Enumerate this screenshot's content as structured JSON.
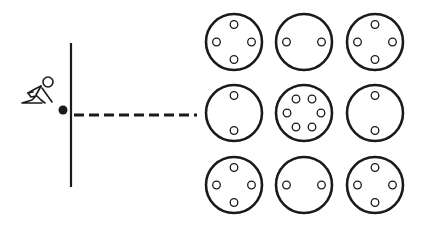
{
  "diagram": {
    "colors": {
      "stroke": "#1a1a1a",
      "background": "#ffffff"
    },
    "start_line": {
      "x": 71,
      "y1": 43,
      "y2": 187
    },
    "ball": {
      "cx": 63,
      "cy": 110,
      "r": 4.5
    },
    "dashed_path": {
      "x1": 74,
      "x2": 197,
      "y": 115
    },
    "grid": {
      "radius": 28,
      "columns_x": [
        234,
        304,
        375
      ],
      "rows_y": [
        42,
        113,
        185
      ],
      "cells": [
        {
          "row": 0,
          "col": 0,
          "holes": 4,
          "pattern": "cross"
        },
        {
          "row": 0,
          "col": 1,
          "holes": 2,
          "pattern": "horizontal"
        },
        {
          "row": 0,
          "col": 2,
          "holes": 4,
          "pattern": "cross"
        },
        {
          "row": 1,
          "col": 0,
          "holes": 2,
          "pattern": "vertical"
        },
        {
          "row": 1,
          "col": 1,
          "holes": 6,
          "pattern": "ring"
        },
        {
          "row": 1,
          "col": 2,
          "holes": 2,
          "pattern": "vertical"
        },
        {
          "row": 2,
          "col": 0,
          "holes": 4,
          "pattern": "cross"
        },
        {
          "row": 2,
          "col": 1,
          "holes": 2,
          "pattern": "horizontal"
        },
        {
          "row": 2,
          "col": 2,
          "holes": 4,
          "pattern": "cross"
        }
      ]
    }
  }
}
